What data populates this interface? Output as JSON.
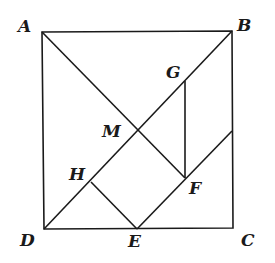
{
  "diagram": {
    "type": "geometry",
    "points": {
      "A": {
        "label": "A",
        "x": 42,
        "y": 32
      },
      "B": {
        "label": "B",
        "x": 232,
        "y": 31
      },
      "C": {
        "label": "C",
        "x": 233,
        "y": 228
      },
      "D": {
        "label": "D",
        "x": 44,
        "y": 229
      },
      "M": {
        "label": "M",
        "x": 137,
        "y": 131
      },
      "G": {
        "label": "G",
        "x": 185,
        "y": 81
      },
      "F": {
        "label": "F",
        "x": 185,
        "y": 178
      },
      "H": {
        "label": "H",
        "x": 91,
        "y": 182
      },
      "E": {
        "label": "E",
        "x": 137,
        "y": 229
      },
      "P": {
        "label": "",
        "x": 232,
        "y": 131
      }
    },
    "segments": [
      [
        "A",
        "B"
      ],
      [
        "B",
        "C"
      ],
      [
        "C",
        "D"
      ],
      [
        "D",
        "A"
      ],
      [
        "A",
        "F"
      ],
      [
        "D",
        "B"
      ],
      [
        "G",
        "F"
      ],
      [
        "H",
        "E"
      ],
      [
        "E",
        "P"
      ]
    ],
    "line_color": "#1a1a1a"
  }
}
